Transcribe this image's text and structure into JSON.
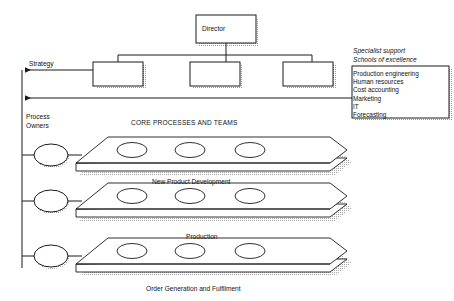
{
  "diagram": {
    "title_core": "CORE PROCESSES AND TEAMS",
    "org": {
      "director_label": "Director",
      "subordinates": [
        "",
        "",
        ""
      ]
    },
    "left_axis": {
      "strategy_label": "Strategy",
      "process_owners_label_line1": "Process",
      "process_owners_label_line2": "Owners"
    },
    "specialist": {
      "heading_line1": "Specialist support",
      "heading_line2": "Schools of excellence",
      "items": [
        "Production engineering",
        "Human resources",
        "Cost accounting",
        "Marketing",
        "IT",
        "Forecasting"
      ]
    },
    "processes": [
      {
        "label": "New Product Development",
        "teams": 3
      },
      {
        "label": "Production",
        "teams": 3
      },
      {
        "label": "Order Generation and Fulfilment",
        "teams": 3
      }
    ],
    "colors": {
      "line": "#1a1a1a",
      "fill": "#ffffff",
      "shadow": "#9a9a9a",
      "background": "#ffffff"
    }
  }
}
